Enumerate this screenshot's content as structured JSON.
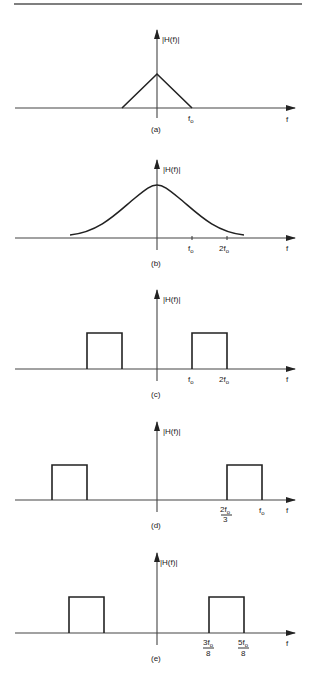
{
  "figure": {
    "y_axis_label": "|H(f)|",
    "x_axis_label": "f",
    "panels": [
      {
        "id": "a",
        "caption": "(a)",
        "shape": "triangle",
        "description": "Triangular magnitude response centered at f=0, reaching zero at ±f_o",
        "ticks": [
          {
            "label": "f",
            "sub": "o",
            "pos": 1
          }
        ]
      },
      {
        "id": "b",
        "caption": "(b)",
        "shape": "gaussian",
        "description": "Bell-shaped (Gaussian) magnitude response centered at f=0",
        "ticks": [
          {
            "label": "f",
            "sub": "o",
            "pos": 1
          },
          {
            "label": "2f",
            "sub": "o",
            "pos": 2
          }
        ]
      },
      {
        "id": "c",
        "caption": "(c)",
        "shape": "bandpass",
        "description": "Ideal bandpass response with passband from f_o to 2f_o (and mirror)",
        "band": [
          1,
          2
        ],
        "ticks": [
          {
            "label": "f",
            "sub": "o",
            "pos": 1
          },
          {
            "label": "2f",
            "sub": "o",
            "pos": 2
          }
        ]
      },
      {
        "id": "d",
        "caption": "(d)",
        "shape": "bandpass",
        "description": "Ideal bandpass response with passband from 2f_o/3 to f_o (and mirror)",
        "band": [
          0.6667,
          1
        ],
        "ticks": [
          {
            "label": "2f",
            "sub": "o",
            "den": "3",
            "pos": 0.6667
          },
          {
            "label": "f",
            "sub": "o",
            "pos": 1
          }
        ]
      },
      {
        "id": "e",
        "caption": "(e)",
        "shape": "bandpass",
        "description": "Ideal bandpass response with passband from 3f_o/8 to 5f_o/8 (and mirror)",
        "band": [
          0.375,
          0.625
        ],
        "ticks": [
          {
            "label": "3f",
            "sub": "o",
            "den": "8",
            "pos": 0.375
          },
          {
            "label": "5f",
            "sub": "o",
            "den": "8",
            "pos": 0.625
          }
        ]
      }
    ]
  }
}
